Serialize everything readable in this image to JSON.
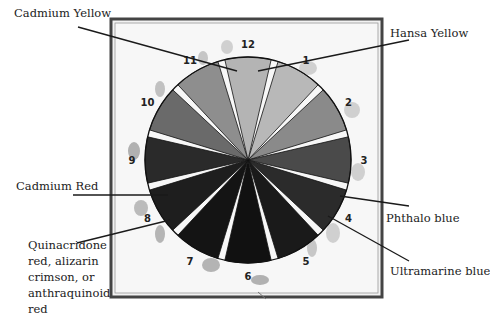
{
  "diagram": {
    "title": "",
    "type": "color-wheel",
    "center": [
      248,
      160
    ],
    "radius": 103,
    "segments": [
      {
        "number": "1",
        "fill": "#b8b8b8"
      },
      {
        "number": "2",
        "fill": "#8a8a8a"
      },
      {
        "number": "3",
        "fill": "#4a4a4a"
      },
      {
        "number": "4",
        "fill": "#2b2b2b"
      },
      {
        "number": "5",
        "fill": "#1a1a1a"
      },
      {
        "number": "6",
        "fill": "#111111"
      },
      {
        "number": "7",
        "fill": "#141414"
      },
      {
        "number": "8",
        "fill": "#1e1e1e"
      },
      {
        "number": "9",
        "fill": "#2a2a2a"
      },
      {
        "number": "10",
        "fill": "#6a6a6a"
      },
      {
        "number": "11",
        "fill": "#8e8e8e"
      },
      {
        "number": "12",
        "fill": "#b4b4b4"
      }
    ],
    "callouts": [
      {
        "id": "cadmium-yellow",
        "text": "Cadmium Yellow",
        "x": 14,
        "y": 6
      },
      {
        "id": "hansa-yellow",
        "text": "Hansa Yellow",
        "x": 390,
        "y": 26
      },
      {
        "id": "cadmium-red",
        "text": "Cadmium Red",
        "x": 16,
        "y": 179
      },
      {
        "id": "phthalo-blue",
        "text": "Phthalo blue",
        "x": 386,
        "y": 211
      },
      {
        "id": "ultramarine-blue",
        "text": "Ultramarine blue",
        "x": 390,
        "y": 264
      },
      {
        "id": "quinacridone",
        "text": "Quinacridone red, alizarin crimson, or anthraquinoid red",
        "x": 28,
        "y": 237
      }
    ]
  }
}
